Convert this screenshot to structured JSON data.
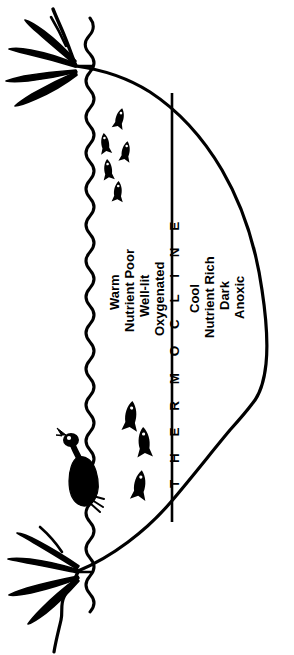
{
  "figure": {
    "orientation": "rotated-90",
    "background_color": "#ffffff",
    "ink_color": "#000000"
  },
  "divider": {
    "thermocline_label": "T H E R M O C L I N E"
  },
  "epilimnion": {
    "labels": [
      "Warm",
      "Nutrient Poor",
      "Well-lit",
      "Oxygenated"
    ]
  },
  "hypolimnion": {
    "labels": [
      "Cool",
      "Nutrient Rich",
      "Dark",
      "Anoxic"
    ]
  },
  "icons": {
    "water_surface": "wavy-water-surface-line",
    "lake_basin": "lake-basin-outline",
    "thermocline_line": "thermocline-divider-line",
    "plant_top": "cattail-plant-icon",
    "plant_bottom": "cattail-plant-icon",
    "waterfowl": "duck-icon",
    "fish": "fish-icon"
  },
  "fauna": {
    "small_fish_count": 5,
    "large_fish_count": 3,
    "waterfowl_count": 1
  }
}
